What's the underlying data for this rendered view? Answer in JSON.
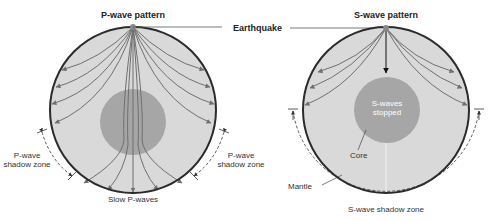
{
  "diagram": {
    "left_panel": {
      "title": "P-wave pattern",
      "left_shadow_label_line1": "P-wave",
      "left_shadow_label_line2": "shadow zone",
      "right_shadow_label_line1": "P-wave",
      "right_shadow_label_line2": "shadow zone",
      "bottom_label": "Slow P-waves"
    },
    "right_panel": {
      "title": "S-wave pattern",
      "core_text_line1": "S-waves",
      "core_text_line2": "stopped",
      "core_label": "Core",
      "mantle_label": "Mantle",
      "shadow_label": "S-wave shadow zone"
    },
    "earthquake_label": "Earthquake",
    "colors": {
      "mantle": "#d9d9d9",
      "core": "#a6a6a6",
      "outline": "#2b2b2b",
      "ray": "#6f6f6f"
    }
  }
}
